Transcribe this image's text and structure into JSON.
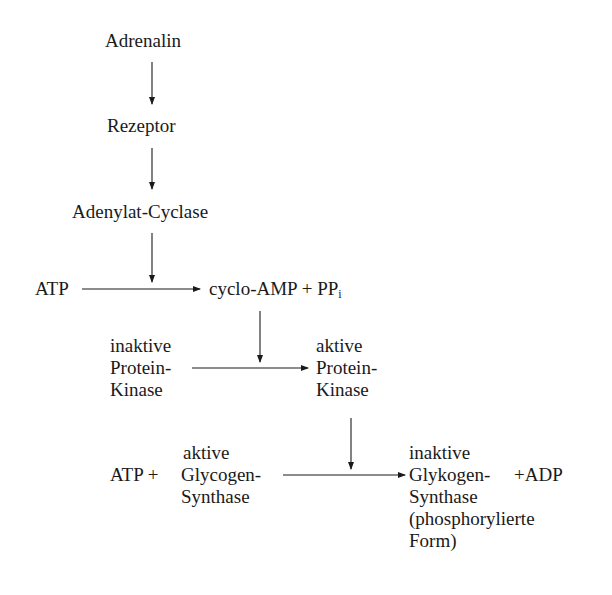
{
  "diagram": {
    "type": "signal-cascade",
    "nodes": {
      "adrenalin": "Adrenalin",
      "rezeptor": "Rezeptor",
      "adenylat_cyclase": "Adenylat-Cyclase",
      "atp_1": "ATP",
      "cyclo_amp": "cyclo-AMP + PP",
      "cyclo_amp_sub": "i",
      "inactive_kinase": [
        "inaktive",
        "Protein-",
        "Kinase"
      ],
      "active_kinase": [
        "aktive",
        "Protein-",
        "Kinase"
      ],
      "atp_2": "ATP +",
      "active_synthase": [
        "aktive",
        "Glycogen-",
        "Synthase"
      ],
      "inactive_synthase": [
        "inaktive",
        "Glykogen-",
        "Synthase",
        "(phosphorylierte",
        "Form)"
      ],
      "adp": "+ADP"
    },
    "edges": [
      {
        "from": "Adrenalin",
        "to": "Rezeptor"
      },
      {
        "from": "Rezeptor",
        "to": "Adenylat-Cyclase"
      },
      {
        "from": "Adenylat-Cyclase",
        "to": "ATP → cyclo-AMP reaction",
        "role": "catalyst"
      },
      {
        "from": "ATP",
        "to": "cyclo-AMP + PPi"
      },
      {
        "from": "cyclo-AMP",
        "to": "Protein-Kinase activation",
        "role": "activator"
      },
      {
        "from": "inaktive Protein-Kinase",
        "to": "aktive Protein-Kinase"
      },
      {
        "from": "aktive Protein-Kinase",
        "to": "Glycogen-Synthase phosphorylation",
        "role": "catalyst"
      },
      {
        "from": "ATP + aktive Glycogen-Synthase",
        "to": "inaktive Glykogen-Synthase (phosphorylierte Form) + ADP"
      }
    ]
  }
}
